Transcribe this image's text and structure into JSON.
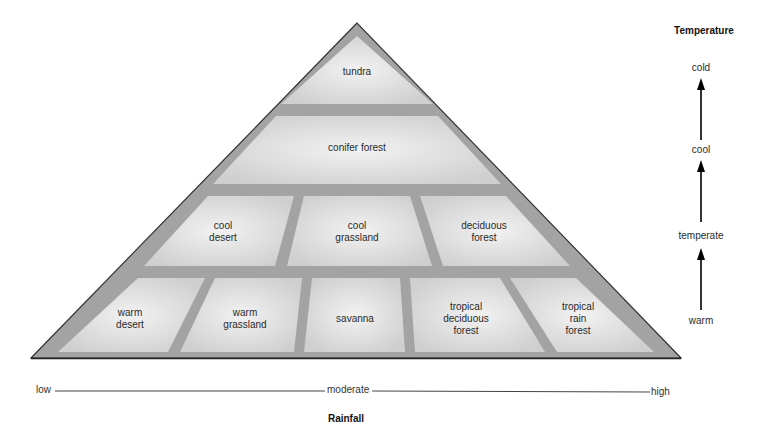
{
  "pyramid": {
    "rows": [
      {
        "row": "top",
        "biomes": [
          {
            "id": "tundra",
            "label": "tundra"
          }
        ]
      },
      {
        "row": "second",
        "biomes": [
          {
            "id": "conifer-forest",
            "label": "conifer forest"
          }
        ]
      },
      {
        "row": "third",
        "biomes": [
          {
            "id": "cool-desert",
            "label": "cool\ndesert"
          },
          {
            "id": "cool-grassland",
            "label": "cool\ngrassland"
          },
          {
            "id": "deciduous-forest",
            "label": "deciduous\nforest"
          }
        ]
      },
      {
        "row": "bottom",
        "biomes": [
          {
            "id": "warm-desert",
            "label": "warm\ndesert"
          },
          {
            "id": "warm-grassland",
            "label": "warm\ngrassland"
          },
          {
            "id": "savanna",
            "label": "savanna"
          },
          {
            "id": "tropical-deciduous-forest",
            "label": "tropical\ndeciduous\nforest"
          },
          {
            "id": "tropical-rain-forest",
            "label": "tropical\nrain\nforest"
          }
        ]
      }
    ]
  },
  "temperature_axis": {
    "title": "Temperature",
    "levels": [
      "warm",
      "temperate",
      "cool",
      "cold"
    ]
  },
  "rainfall_axis": {
    "title": "Rainfall",
    "levels": [
      "low",
      "moderate",
      "high"
    ]
  },
  "colors": {
    "tile": "#dcdcdc",
    "grout": "#9a9a9a",
    "outline": "#333333"
  }
}
